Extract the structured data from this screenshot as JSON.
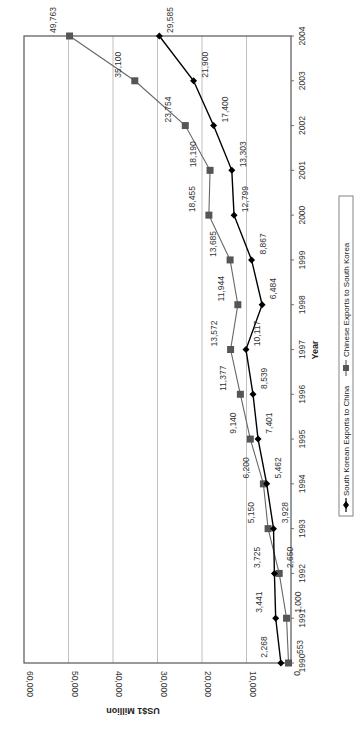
{
  "chart_data": {
    "type": "line",
    "orientation": "rotated-90-clockwise",
    "title": "",
    "xlabel": "Year",
    "ylabel": "US$1 Million",
    "x": [
      1990,
      1991,
      1992,
      1993,
      1994,
      1995,
      1996,
      1997,
      1998,
      1999,
      2000,
      2001,
      2002,
      2003,
      2004
    ],
    "categories": [
      "1990",
      "1991",
      "1992",
      "1993",
      "1994",
      "1995",
      "1996",
      "1997",
      "1998",
      "1999",
      "2000",
      "2001",
      "2002",
      "2003",
      "2004"
    ],
    "ylim": [
      0,
      60000
    ],
    "yticks": [
      0,
      10000,
      20000,
      30000,
      40000,
      50000,
      60000
    ],
    "ytick_labels": [
      "0",
      "10,000",
      "20,000",
      "30,000",
      "40,000",
      "50,000",
      "60,000"
    ],
    "grid": true,
    "legend_position": "bottom",
    "series": [
      {
        "name": "South Korean Exports to China",
        "marker": "diamond",
        "color": "#000000",
        "values": [
          2268,
          3441,
          3725,
          3928,
          5462,
          7401,
          8539,
          10117,
          6484,
          8867,
          12799,
          13303,
          17400,
          21900,
          29585
        ],
        "labels": [
          "2,268",
          "3,441",
          "3,725",
          "3,928",
          "5,462",
          "7,401",
          "8,539",
          "10,117",
          "6,484",
          "8,867",
          "12,799",
          "13,303",
          "17,400",
          "21,900",
          "29,585"
        ]
      },
      {
        "name": "Chinese Exports to South Korea",
        "marker": "square",
        "color": "#555555",
        "values": [
          553,
          1000,
          2650,
          5150,
          6200,
          9140,
          11377,
          13572,
          11944,
          13685,
          18455,
          18190,
          23754,
          35100,
          49763
        ],
        "labels": [
          "553",
          "1,000",
          "2,650",
          "5,150",
          "6,200",
          "9,140",
          "11,377",
          "13,572",
          "11,944",
          "13,685",
          "18,455",
          "18,190",
          "23,754",
          "35,100",
          "49,763"
        ]
      }
    ]
  },
  "axis": {
    "x_title": "Year",
    "y_title": "US$1 Million"
  },
  "legend": {
    "items": [
      {
        "label": "South Korean Exports to China",
        "marker": "diamond"
      },
      {
        "label": "Chinese Exports to South Korea",
        "marker": "square"
      }
    ]
  },
  "colors": {
    "series_1": "#000000",
    "series_2": "#555555",
    "series_2_line": "#666666",
    "grid": "#b0b0b0",
    "axis": "#555555"
  }
}
